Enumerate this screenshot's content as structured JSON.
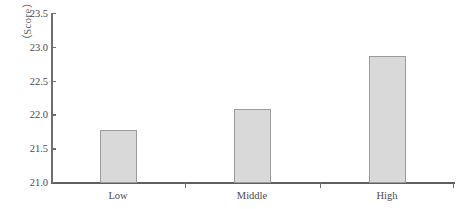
{
  "chart_data": {
    "type": "bar",
    "title": "",
    "xlabel": "",
    "ylabel": "（Score）",
    "categories": [
      "Low",
      "Middle",
      "High"
    ],
    "values": [
      21.78,
      22.1,
      22.88
    ],
    "ylim": [
      21.0,
      23.5
    ],
    "ytick_labels": [
      "23.5",
      "23.0",
      "22.5",
      "22.0",
      "21.5",
      "21.0"
    ],
    "ytick_values": [
      23.5,
      23.0,
      22.5,
      22.0,
      21.5,
      21.0
    ],
    "grid": false,
    "legend": null,
    "bar_fill_color": "#d9d9d9",
    "bar_border_color": "#9b9b9b",
    "axis_color": "#6f6f6f",
    "text_color": "#4a4a4a"
  },
  "axis": {
    "y_title": "（Score）",
    "y_labels": [
      "23.5",
      "23.0",
      "22.5",
      "22.0",
      "21.5",
      "21.0"
    ],
    "x_labels": [
      "Low",
      "Middle",
      "High"
    ]
  }
}
